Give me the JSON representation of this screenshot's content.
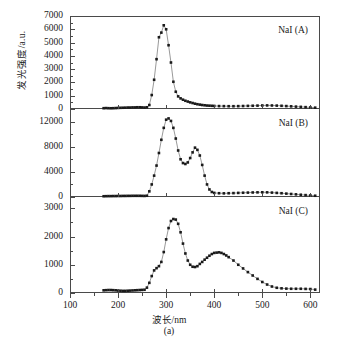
{
  "axes": {
    "x_title": "波长/nm",
    "y_title": "发光强度/a.u.",
    "x_ticks": [
      "100",
      "200",
      "300",
      "400",
      "500",
      "600"
    ],
    "x_min": 100,
    "x_max": 620
  },
  "caption": "(a)",
  "panels": [
    {
      "id": "A",
      "tag": "NaI (A)",
      "y_ticks": [
        "0",
        "1000",
        "2000",
        "3000",
        "4000",
        "5000",
        "6000",
        "7000"
      ],
      "y_min": 0,
      "y_max": 7000
    },
    {
      "id": "B",
      "tag": "NaI (B)",
      "y_ticks": [
        "0",
        "4000",
        "8000",
        "12000"
      ],
      "y_min": 0,
      "y_max": 14000
    },
    {
      "id": "C",
      "tag": "NaI (C)",
      "y_ticks": [
        "0",
        "1000",
        "2000",
        "3000"
      ],
      "y_min": 0,
      "y_max": 3400
    }
  ],
  "chart_data": {
    "type": "line",
    "title": "",
    "xlabel": "波长/nm",
    "ylabel": "发光强度/a.u.",
    "xlim": [
      100,
      620
    ],
    "grid": false,
    "legend": false,
    "marker": "filled-square",
    "panels": [
      {
        "name": "NaI (A)",
        "ylim": [
          0,
          7000
        ],
        "x": [
          170,
          175,
          180,
          185,
          190,
          195,
          200,
          205,
          210,
          215,
          220,
          225,
          230,
          235,
          240,
          245,
          250,
          255,
          260,
          265,
          270,
          275,
          280,
          285,
          290,
          295,
          300,
          305,
          310,
          315,
          320,
          325,
          330,
          335,
          340,
          345,
          350,
          355,
          360,
          365,
          370,
          375,
          380,
          385,
          390,
          395,
          400,
          410,
          420,
          430,
          440,
          450,
          460,
          470,
          480,
          490,
          500,
          510,
          520,
          530,
          540,
          550,
          560,
          570,
          580,
          590,
          600,
          610
        ],
        "y": [
          60,
          70,
          60,
          55,
          60,
          70,
          80,
          90,
          95,
          100,
          110,
          110,
          120,
          120,
          130,
          130,
          120,
          110,
          130,
          300,
          1050,
          2200,
          3750,
          5400,
          5750,
          6300,
          6000,
          4800,
          3500,
          2050,
          1300,
          950,
          800,
          700,
          620,
          560,
          500,
          450,
          400,
          360,
          330,
          300,
          280,
          260,
          250,
          240,
          230,
          220,
          215,
          210,
          210,
          215,
          225,
          235,
          245,
          255,
          265,
          270,
          265,
          255,
          240,
          220,
          200,
          180,
          160,
          140,
          120,
          100
        ]
      },
      {
        "name": "NaI (B)",
        "ylim": [
          0,
          14000
        ],
        "x": [
          170,
          175,
          180,
          185,
          190,
          195,
          200,
          205,
          210,
          215,
          220,
          225,
          230,
          235,
          240,
          245,
          250,
          255,
          260,
          265,
          270,
          275,
          280,
          285,
          290,
          295,
          300,
          305,
          310,
          315,
          320,
          325,
          330,
          335,
          340,
          345,
          350,
          355,
          360,
          365,
          370,
          375,
          380,
          385,
          390,
          395,
          400,
          410,
          420,
          430,
          440,
          450,
          460,
          470,
          480,
          490,
          500,
          510,
          520,
          530,
          540,
          550,
          560,
          570,
          580,
          590,
          600,
          610
        ],
        "y": [
          120,
          130,
          140,
          140,
          150,
          150,
          160,
          160,
          170,
          170,
          180,
          180,
          190,
          190,
          190,
          190,
          180,
          170,
          200,
          900,
          2000,
          3400,
          5000,
          7000,
          9100,
          11000,
          12300,
          12500,
          12100,
          11000,
          9300,
          7400,
          6000,
          5400,
          5250,
          5500,
          6200,
          7100,
          7850,
          7500,
          6600,
          5100,
          3400,
          2000,
          1200,
          800,
          650,
          600,
          580,
          600,
          620,
          650,
          680,
          700,
          720,
          740,
          750,
          740,
          700,
          650,
          600,
          540,
          480,
          420,
          360,
          300,
          250,
          200
        ]
      },
      {
        "name": "NaI (C)",
        "ylim": [
          0,
          3400
        ],
        "x": [
          170,
          175,
          180,
          185,
          190,
          195,
          200,
          205,
          210,
          215,
          220,
          225,
          230,
          235,
          240,
          245,
          250,
          255,
          260,
          265,
          270,
          275,
          280,
          285,
          290,
          295,
          300,
          305,
          310,
          315,
          320,
          325,
          330,
          335,
          340,
          345,
          350,
          355,
          360,
          365,
          370,
          375,
          380,
          385,
          390,
          395,
          400,
          405,
          410,
          415,
          420,
          425,
          430,
          440,
          450,
          460,
          470,
          480,
          490,
          500,
          510,
          520,
          530,
          540,
          550,
          560,
          570,
          580,
          590,
          600,
          610
        ],
        "y": [
          95,
          100,
          105,
          105,
          100,
          95,
          85,
          80,
          75,
          75,
          80,
          85,
          90,
          95,
          100,
          105,
          110,
          115,
          190,
          360,
          600,
          800,
          880,
          950,
          1100,
          1450,
          1900,
          2300,
          2550,
          2620,
          2600,
          2450,
          2150,
          1750,
          1400,
          1150,
          1000,
          930,
          920,
          950,
          1030,
          1100,
          1180,
          1250,
          1320,
          1380,
          1420,
          1430,
          1440,
          1420,
          1380,
          1330,
          1270,
          1150,
          1000,
          870,
          740,
          620,
          500,
          390,
          300,
          230,
          185,
          165,
          155,
          150,
          150,
          150,
          145,
          140,
          120
        ]
      }
    ]
  }
}
